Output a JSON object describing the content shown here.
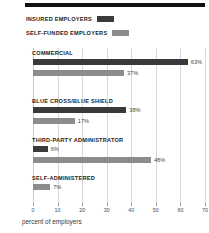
{
  "chart_data": {
    "type": "bar",
    "orientation": "horizontal",
    "title": "",
    "xlabel": "percent of employers",
    "ylabel": "",
    "xlim": [
      0,
      70
    ],
    "grid": true,
    "legend_position": "top-left",
    "categories": [
      "COMMERCIAL",
      "BLUE CROSS/BLUE SHIELD",
      "THIRD-PARTY ADMINISTRATOR",
      "SELF-ADMINISTERED"
    ],
    "series": [
      {
        "name": "INSURED EMPLOYERS",
        "color": "#3a3a3a",
        "values": [
          63,
          38,
          6,
          null
        ]
      },
      {
        "name": "SELF-FUNDED EMPLOYERS",
        "color": "#8c8c8c",
        "values": [
          37,
          17,
          48,
          7
        ]
      }
    ],
    "value_labels": {
      "commercial_insured": "63%",
      "commercial_selffunded": "37%",
      "bcbs_insured": "38%",
      "bcbs_selffunded": "17%",
      "tpa_insured": "6%",
      "tpa_selffunded": "48%",
      "selfadmin_selffunded": "7%"
    },
    "xticks": [
      0,
      10,
      20,
      30,
      40,
      50,
      60,
      70
    ],
    "xtick_labels": [
      "0",
      "10",
      "20",
      "30",
      "40",
      "50",
      "60",
      "70"
    ]
  },
  "legend": {
    "items": [
      {
        "label": "INSURED EMPLOYERS",
        "color": "#3a3a3a"
      },
      {
        "label": "SELF-FUNDED EMPLOYERS",
        "color": "#8c8c8c"
      }
    ]
  },
  "axis": {
    "xlabel": "percent of employers",
    "ticks": [
      "0",
      "10",
      "20",
      "30",
      "40",
      "50",
      "60",
      "70"
    ]
  },
  "groups": [
    {
      "label": "COMMERCIAL",
      "bars": [
        {
          "series": "INSURED EMPLOYERS",
          "value": 63,
          "value_label": "63%"
        },
        {
          "series": "SELF-FUNDED EMPLOYERS",
          "value": 37,
          "value_label": "37%"
        }
      ]
    },
    {
      "label": "BLUE CROSS/BLUE SHIELD",
      "bars": [
        {
          "series": "INSURED EMPLOYERS",
          "value": 38,
          "value_label": "38%"
        },
        {
          "series": "SELF-FUNDED EMPLOYERS",
          "value": 17,
          "value_label": "17%"
        }
      ]
    },
    {
      "label": "THIRD-PARTY ADMINISTRATOR",
      "bars": [
        {
          "series": "INSURED EMPLOYERS",
          "value": 6,
          "value_label": "6%"
        },
        {
          "series": "SELF-FUNDED EMPLOYERS",
          "value": 48,
          "value_label": "48%"
        }
      ]
    },
    {
      "label": "SELF-ADMINISTERED",
      "bars": [
        {
          "series": "SELF-FUNDED EMPLOYERS",
          "value": 7,
          "value_label": "7%"
        }
      ]
    }
  ]
}
